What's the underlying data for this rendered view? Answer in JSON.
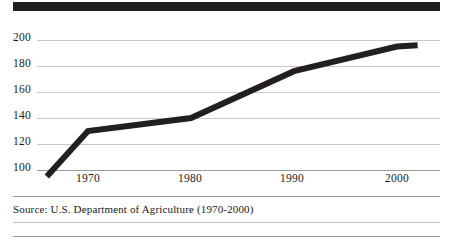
{
  "chart_data": {
    "type": "line",
    "title": "",
    "subtitle": "",
    "xlabel": "",
    "ylabel": "",
    "x": [
      1966,
      1970,
      1980,
      1990,
      2000,
      2002
    ],
    "values": [
      95,
      130,
      140,
      176,
      195,
      196
    ],
    "series": [
      {
        "name": "Index",
        "x": [
          1966,
          1970,
          1980,
          1990,
          2000,
          2002
        ],
        "values": [
          95,
          130,
          140,
          176,
          195,
          196
        ]
      }
    ],
    "xlim": [
      1966,
      2002
    ],
    "ylim": [
      95,
      203
    ],
    "x_ticks": [
      1970,
      1980,
      1990,
      2000
    ],
    "x_tick_labels": [
      "1970",
      "1980",
      "1990",
      "2000"
    ],
    "y_ticks": [
      100,
      120,
      140,
      160,
      180,
      200
    ],
    "y_tick_labels": [
      "100",
      "120",
      "140",
      "160",
      "180",
      "200"
    ],
    "grid": true,
    "legend": false,
    "legend_position": "none",
    "line_color": "#231f20",
    "grid_color": "#c9c9c9",
    "axis_color": "#9a9a9a"
  },
  "header": {
    "bar_color": "#231f20"
  },
  "footer": {
    "source_text": "Source:  U.S. Department of Agriculture (1970-2000)"
  }
}
